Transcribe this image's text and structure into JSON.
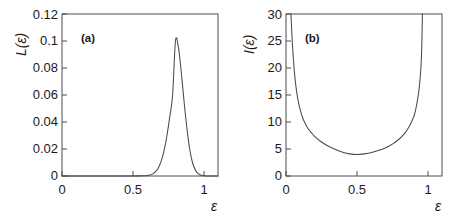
{
  "figure": {
    "background": "#ffffff",
    "line_color": "#4a4a4a",
    "axis_color": "#4d4d4d",
    "panels": [
      "a",
      "b"
    ]
  },
  "panel_a": {
    "tag": "(a)",
    "ylabel": "L(ε)",
    "xlabel": "ε",
    "ytick_labels": [
      "0",
      "0.02",
      "0.04",
      "0.06",
      "0.08",
      "0.1",
      "0.12"
    ],
    "xtick_labels": [
      "0",
      "0.5",
      "1"
    ]
  },
  "panel_b": {
    "tag": "(b)",
    "ylabel": "I(ε)",
    "xlabel": "ε",
    "ytick_labels": [
      "0",
      "5",
      "10",
      "15",
      "20",
      "25",
      "30"
    ],
    "xtick_labels": [
      "0",
      "0.5",
      "1"
    ]
  },
  "chart_data": [
    {
      "type": "line",
      "panel": "a",
      "title": "(a)",
      "xlabel": "ε",
      "ylabel": "L(ε)",
      "xlim": [
        0,
        1.1
      ],
      "ylim": [
        0,
        0.12
      ],
      "xticks": [
        0,
        0.5,
        1
      ],
      "yticks": [
        0,
        0.02,
        0.04,
        0.06,
        0.08,
        0.1,
        0.12
      ],
      "grid": false,
      "legend": null,
      "annotations": [
        {
          "text": "(a)",
          "x": 0.13,
          "y": 0.108
        }
      ],
      "description": "Narrow unimodal peak centred near epsilon = 0.80 with maximum value 0.10; essentially zero for epsilon < 0.65 and epsilon > 0.95",
      "series": [
        {
          "name": "L(ε)",
          "peak_x": 0.8,
          "peak_y": 0.1,
          "sigma": 0.042,
          "x": [
            0.0,
            0.05,
            0.1,
            0.15,
            0.2,
            0.25,
            0.3,
            0.35,
            0.4,
            0.45,
            0.5,
            0.55,
            0.58,
            0.6,
            0.62,
            0.64,
            0.66,
            0.68,
            0.7,
            0.72,
            0.74,
            0.76,
            0.78,
            0.8,
            0.82,
            0.84,
            0.86,
            0.88,
            0.9,
            0.92,
            0.94,
            0.96,
            0.98,
            1.0,
            1.05,
            1.1
          ],
          "y": [
            0.0,
            0.0,
            0.0,
            0.0,
            0.0,
            0.0,
            0.0,
            0.0,
            0.0,
            0.0,
            0.0,
            0.0001,
            0.0002,
            0.0004,
            0.0008,
            0.0016,
            0.0032,
            0.0062,
            0.0112,
            0.019,
            0.03,
            0.044,
            0.06,
            0.1,
            0.096,
            0.078,
            0.056,
            0.036,
            0.02,
            0.01,
            0.0044,
            0.0017,
            0.0006,
            0.0002,
            0.0,
            0.0
          ]
        }
      ]
    },
    {
      "type": "line",
      "panel": "b",
      "title": "(b)",
      "xlabel": "ε",
      "ylabel": "I(ε)",
      "xlim": [
        0,
        1.1
      ],
      "ylim": [
        0,
        30
      ],
      "xticks": [
        0,
        0.5,
        1
      ],
      "yticks": [
        0,
        5,
        10,
        15,
        20,
        25,
        30
      ],
      "grid": false,
      "legend": null,
      "annotations": [
        {
          "text": "(b)",
          "x": 0.13,
          "y": 26.5
        }
      ],
      "description": "U-shaped (convex) curve diverging at epsilon -> 0 and epsilon -> 1, with a flat minimum of about 4 near epsilon = 0.5",
      "series": [
        {
          "name": "I(ε)",
          "min_x": 0.5,
          "min_y": 4.0,
          "x": [
            0.035,
            0.04,
            0.045,
            0.05,
            0.06,
            0.07,
            0.08,
            0.09,
            0.1,
            0.12,
            0.14,
            0.16,
            0.18,
            0.2,
            0.25,
            0.3,
            0.35,
            0.4,
            0.45,
            0.5,
            0.55,
            0.6,
            0.65,
            0.7,
            0.75,
            0.8,
            0.84,
            0.87,
            0.89,
            0.905,
            0.92,
            0.93,
            0.94,
            0.95,
            0.957,
            0.962
          ],
          "y": [
            30.0,
            27.0,
            24.5,
            22.5,
            19.0,
            16.6,
            14.8,
            13.4,
            12.3,
            10.6,
            9.5,
            8.6,
            8.0,
            7.4,
            6.3,
            5.5,
            4.9,
            4.4,
            4.1,
            4.0,
            4.1,
            4.3,
            4.7,
            5.2,
            5.9,
            6.9,
            8.0,
            9.2,
            10.3,
            11.3,
            13.0,
            14.5,
            16.5,
            19.5,
            23.5,
            30.0
          ]
        }
      ]
    }
  ]
}
